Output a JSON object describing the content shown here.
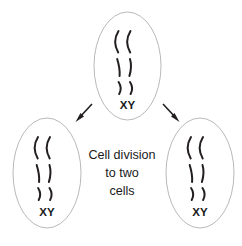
{
  "diagram": {
    "title": "Cell division to two cells",
    "background_color": "#ffffff",
    "outline_color": "#b9b9b9",
    "chromosome_color": "#231f20",
    "text_color": "#1a1a1a",
    "caption": {
      "line1": "Cell division",
      "line2": "to two",
      "line3": "cells"
    },
    "cells": [
      {
        "id": "parent-cell",
        "position": "top-center",
        "label": "XY",
        "chromosome_pairs": 3,
        "chromosome_count": 6
      },
      {
        "id": "daughter-cell-left",
        "position": "bottom-left",
        "label": "XY",
        "chromosome_pairs": 3,
        "chromosome_count": 6
      },
      {
        "id": "daughter-cell-right",
        "position": "bottom-right",
        "label": "XY",
        "chromosome_pairs": 3,
        "chromosome_count": 6
      }
    ],
    "arrows": [
      {
        "id": "arrow-left",
        "from": "parent-cell",
        "to": "daughter-cell-left",
        "direction": "down-left"
      },
      {
        "id": "arrow-right",
        "from": "parent-cell",
        "to": "daughter-cell-right",
        "direction": "down-right"
      }
    ]
  }
}
